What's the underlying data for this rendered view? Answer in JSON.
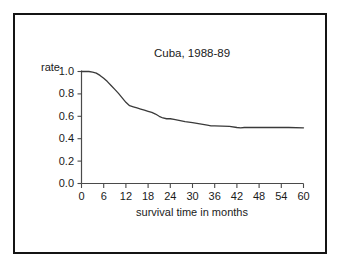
{
  "figure": {
    "background_color": "#ffffff",
    "frame_color": "#141414",
    "line_color": "#3a3a3a",
    "axis_color": "#4a4a4a"
  },
  "chart_data": {
    "type": "line",
    "title": "Cuba, 1988-89",
    "xlabel": "survival time in months",
    "ylabel": "rate",
    "xlim": [
      0,
      60
    ],
    "ylim": [
      0.0,
      1.0
    ],
    "grid": false,
    "legend": null,
    "xticks": [
      0,
      6,
      12,
      18,
      24,
      30,
      36,
      42,
      48,
      54,
      60
    ],
    "xtick_labels": [
      "0",
      "6",
      "12",
      "18",
      "24",
      "30",
      "36",
      "42",
      "48",
      "54",
      "60"
    ],
    "yticks": [
      0.0,
      0.2,
      0.4,
      0.6,
      0.8,
      1.0
    ],
    "ytick_labels": [
      "0.0",
      "0.2",
      "0.4",
      "0.6",
      "0.8",
      "1.0"
    ],
    "series": [
      {
        "name": "survival rate",
        "x": [
          0,
          2,
          3,
          4,
          5,
          6,
          7,
          8,
          9,
          10,
          11,
          12,
          13,
          14,
          15,
          16,
          17,
          18,
          19,
          20,
          21,
          22,
          23,
          24,
          25,
          26,
          28,
          30,
          32,
          34,
          35,
          36,
          38,
          40,
          42,
          43,
          44,
          46,
          48,
          52,
          56,
          60
        ],
        "y": [
          1.0,
          1.0,
          0.995,
          0.985,
          0.965,
          0.94,
          0.91,
          0.875,
          0.84,
          0.805,
          0.765,
          0.725,
          0.695,
          0.685,
          0.675,
          0.665,
          0.655,
          0.645,
          0.635,
          0.62,
          0.6,
          0.585,
          0.578,
          0.578,
          0.572,
          0.565,
          0.552,
          0.543,
          0.532,
          0.521,
          0.515,
          0.515,
          0.513,
          0.51,
          0.5,
          0.497,
          0.5,
          0.5,
          0.5,
          0.5,
          0.5,
          0.497
        ]
      }
    ]
  }
}
